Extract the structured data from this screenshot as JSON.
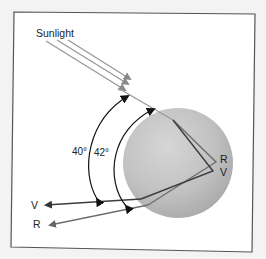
{
  "diagram": {
    "labels": {
      "sunlight": "Sunlight",
      "angle_violet": "40°",
      "angle_red": "42°",
      "exit_red": "R",
      "exit_violet": "V",
      "out_violet": "V",
      "out_red": "R"
    },
    "colors": {
      "background": "#f3f3f3",
      "frame": "#555555",
      "panel": "#ffffff",
      "sunlight_ray": "#9a9a9a",
      "red_ray": "#6e6e6e",
      "violet_ray": "#3c3c3c",
      "drop_fill": "#bdbdbd",
      "arc": "#111111"
    }
  }
}
